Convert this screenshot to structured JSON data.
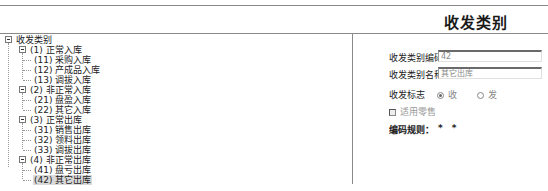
{
  "header": {
    "title": "收发类别"
  },
  "tree": {
    "root": {
      "label": "收发类别",
      "expanded": true
    },
    "groups": [
      {
        "label": "(1) 正常入库",
        "expanded": true,
        "children": [
          {
            "label": "(11) 采购入库"
          },
          {
            "label": "(12) 产成品入库"
          },
          {
            "label": "(13) 调拔入库"
          }
        ]
      },
      {
        "label": "(2) 非正常入库",
        "expanded": true,
        "children": [
          {
            "label": "(21) 盘盈入库"
          },
          {
            "label": "(22) 其它入库"
          }
        ]
      },
      {
        "label": "(3) 正常出库",
        "expanded": true,
        "children": [
          {
            "label": "(31) 销售出库"
          },
          {
            "label": "(32) 领料出库"
          },
          {
            "label": "(33) 调拔出库"
          }
        ]
      },
      {
        "label": "(4) 非正常出库",
        "expanded": true,
        "children": [
          {
            "label": "(41) 盘亏出库"
          },
          {
            "label": "(42) 其它出库",
            "selected": true
          }
        ]
      }
    ]
  },
  "form": {
    "code_label": "收发类别编码",
    "code_value": "42",
    "name_label": "收发类别名称",
    "name_value": "其它出库",
    "flag_label": "收发标志",
    "flag_options": [
      {
        "label": "收",
        "selected": true
      },
      {
        "label": "发",
        "selected": false
      }
    ],
    "retail_checkbox": {
      "label": "适用零售",
      "checked": false,
      "disabled": true
    },
    "rule_label": "编码规则：",
    "rule_value": "* *"
  }
}
